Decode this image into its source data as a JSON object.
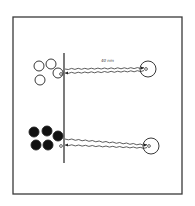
{
  "figure": {
    "frame": {
      "x": 13,
      "y": 17,
      "width": 169,
      "height": 177,
      "stroke": "#3a3a3a"
    },
    "barrier": {
      "x": 64,
      "y1": 53,
      "y2": 163
    },
    "label": "40 nm",
    "top_panel": {
      "cluster": "open-circles",
      "fill": "#ffffff",
      "circles": [
        {
          "cx": 39,
          "cy": 66,
          "r": 5
        },
        {
          "cx": 51,
          "cy": 64,
          "r": 5
        },
        {
          "cx": 58,
          "cy": 73,
          "r": 5
        },
        {
          "cx": 40,
          "cy": 80,
          "r": 5
        }
      ],
      "target": {
        "cx": 148,
        "cy": 69,
        "r": 8
      },
      "tether_y_out": 69,
      "tether_y_in": 73
    },
    "bottom_panel": {
      "cluster": "filled-circles",
      "fill": "#111111",
      "circles": [
        {
          "cx": 34,
          "cy": 132,
          "r": 5
        },
        {
          "cx": 47,
          "cy": 131,
          "r": 5
        },
        {
          "cx": 58,
          "cy": 136,
          "r": 5
        },
        {
          "cx": 36,
          "cy": 145,
          "r": 5
        },
        {
          "cx": 48,
          "cy": 145,
          "r": 5
        }
      ],
      "target": {
        "cx": 151,
        "cy": 146,
        "r": 8
      },
      "tether_y_out": 139,
      "tether_y_in": 145
    }
  }
}
